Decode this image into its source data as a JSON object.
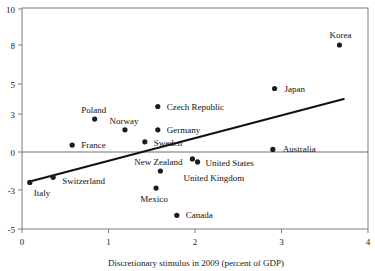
{
  "chart_data": {
    "type": "scatter",
    "title": "",
    "subtitle": "",
    "xlabel": "Discretionary stimulus in 2009 (percent of GDP)",
    "ylabel": "",
    "xlim": [
      0,
      4
    ],
    "ylim": [
      -5,
      10
    ],
    "xticks": [
      0,
      1,
      2,
      3,
      4
    ],
    "xtick_labels": [
      "0",
      "1",
      "2",
      "3",
      "4"
    ],
    "yticks": [
      -5,
      -3,
      0,
      3,
      5,
      8,
      10
    ],
    "ytick_labels": [
      "-5",
      "-3",
      "0",
      "3",
      "5",
      "8",
      "10"
    ],
    "grid": false,
    "legend": "none",
    "zero_line": 0,
    "points": [
      {
        "label": "Italy",
        "x": 0.09,
        "y": -2.4,
        "label_dx": 4,
        "label_dy": 14,
        "anchor": "start"
      },
      {
        "label": "Switzerland",
        "x": 0.36,
        "y": -2.0,
        "label_dx": 9,
        "label_dy": 7,
        "anchor": "start"
      },
      {
        "label": "France",
        "x": 0.58,
        "y": 0.55,
        "label_dx": 9,
        "label_dy": 3,
        "anchor": "start"
      },
      {
        "label": "Poland",
        "x": 0.84,
        "y": 2.6,
        "label_dx": -1,
        "label_dy": -6,
        "anchor": "middle"
      },
      {
        "label": "Norway",
        "x": 1.19,
        "y": 1.75,
        "label_dx": -1,
        "label_dy": -6,
        "anchor": "middle"
      },
      {
        "label": "Sweden",
        "x": 1.42,
        "y": 0.8,
        "label_dx": 9,
        "label_dy": 4,
        "anchor": "start"
      },
      {
        "label": "Czech Republic",
        "x": 1.57,
        "y": 3.5,
        "label_dx": 9,
        "label_dy": 3,
        "anchor": "start"
      },
      {
        "label": "Germany",
        "x": 1.57,
        "y": 1.75,
        "label_dx": 9,
        "label_dy": 3,
        "anchor": "start"
      },
      {
        "label": "New Zealand",
        "x": 1.6,
        "y": -1.5,
        "label_dx": -2,
        "label_dy": -6,
        "anchor": "middle"
      },
      {
        "label": "Mexico",
        "x": 1.55,
        "y": -2.85,
        "label_dx": -2,
        "label_dy": 14,
        "anchor": "middle"
      },
      {
        "label": "Canada",
        "x": 1.79,
        "y": -4.3,
        "label_dx": 9,
        "label_dy": 3,
        "anchor": "start"
      },
      {
        "label": "United States",
        "x": 1.97,
        "y": -0.55,
        "label_dx": 13,
        "label_dy": 7,
        "anchor": "start"
      },
      {
        "label": "",
        "x": 2.03,
        "y": -0.78,
        "label_dx": 0,
        "label_dy": 0,
        "anchor": "start"
      },
      {
        "label": "United Kingdom",
        "x": 1.66,
        "y": -1.95,
        "label_dx": 18,
        "label_dy": 4,
        "anchor": "start",
        "no_dot": true
      },
      {
        "label": "Australia",
        "x": 2.9,
        "y": 0.2,
        "label_dx": 10,
        "label_dy": 3,
        "anchor": "start"
      },
      {
        "label": "Japan",
        "x": 2.92,
        "y": 4.7,
        "label_dx": 10,
        "label_dy": 3,
        "anchor": "start"
      },
      {
        "label": "Korea",
        "x": 3.67,
        "y": 8.0,
        "label_dx": 1,
        "label_dy": -7,
        "anchor": "middle"
      }
    ],
    "trendline": {
      "x0": 0.08,
      "y0": -2.35,
      "x1": 3.72,
      "y1": 4.0
    },
    "colors": {
      "dot": "#1c1c1c",
      "trendline": "#111111",
      "axis": "#7d7d7d",
      "background": "#ffffff"
    }
  }
}
